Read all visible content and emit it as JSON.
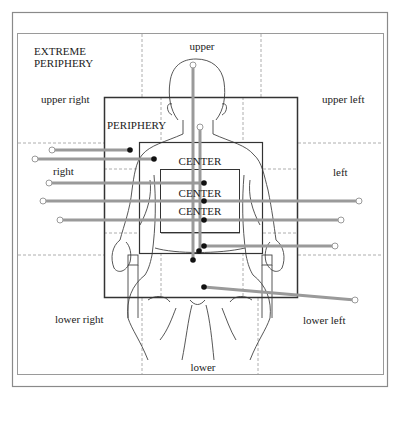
{
  "diagram": {
    "title_zone_label": "EXTREME\nPERIPHERY",
    "extreme_periphery_line1": "EXTREME",
    "extreme_periphery_line2": "PERIPHERY",
    "periphery_label": "PERIPHERY",
    "center_labels": [
      "CENTER",
      "CENTER",
      "CENTER"
    ],
    "zones": {
      "upper": "upper",
      "upper_right": "upper right",
      "upper_left": "upper left",
      "right": "right",
      "left": "left",
      "lower_right": "lower right",
      "lower_left": "lower left",
      "lower": "lower"
    },
    "colors": {
      "frame": "#888888",
      "box": "#333333",
      "pointer_line": "#9a9a9a",
      "dot": "#111111",
      "dashed": "#999999",
      "figure": "#444444"
    },
    "pointers": [
      {
        "from": [
          52,
          150
        ],
        "to": [
          130,
          150
        ]
      },
      {
        "from": [
          35,
          159
        ],
        "to": [
          154,
          159
        ]
      },
      {
        "from": [
          49,
          183
        ],
        "to": [
          204,
          183
        ]
      },
      {
        "from": [
          43,
          201
        ],
        "to": [
          359,
          201
        ]
      },
      {
        "from": [
          60,
          220
        ],
        "to": [
          341,
          220
        ]
      },
      {
        "from": [
          335,
          246
        ],
        "to": [
          204,
          246
        ]
      },
      {
        "from": [
          355,
          300
        ],
        "to": [
          204,
          287
        ]
      },
      {
        "from": [
          184,
          65
        ],
        "to": [
          193,
          260
        ]
      },
      {
        "from": [
          200,
          127
        ],
        "to": [
          200,
          251
        ]
      }
    ]
  }
}
